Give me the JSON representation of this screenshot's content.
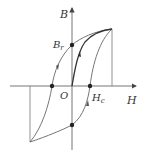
{
  "diagram": {
    "type": "hysteresis-loop",
    "axes": {
      "x_label": "H",
      "y_label": "B",
      "origin_label": "O"
    },
    "points": {
      "remanence_label": "B",
      "remanence_subscript": "r",
      "coercivity_label": "H",
      "coercivity_subscript": "c"
    },
    "colors": {
      "line": "#555555",
      "dot": "#222222"
    }
  }
}
